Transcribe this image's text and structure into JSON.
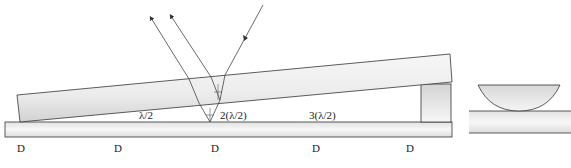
{
  "diagram": {
    "colors": {
      "line": "#333333",
      "glass_light": "#f2f2f2",
      "glass_dark": "#cfcfcf",
      "background": "#ffffff"
    },
    "thickness_labels": [
      "λ/2",
      "2(λ/2)",
      "3(λ/2)"
    ],
    "spacing_labels": [
      "D",
      "D",
      "D",
      "D",
      "D"
    ],
    "elements": {
      "top_plate": "tilted glass plate",
      "bottom_plate": "flat glass plate",
      "spacer": "spacer block",
      "incident_ray": "incident light ray",
      "reflected_rays": [
        "ray reflected from top plate lower surface",
        "ray reflected from bottom plate upper surface"
      ],
      "newton_lens": "plano-convex lens",
      "newton_plate": "flat glass plate"
    }
  }
}
